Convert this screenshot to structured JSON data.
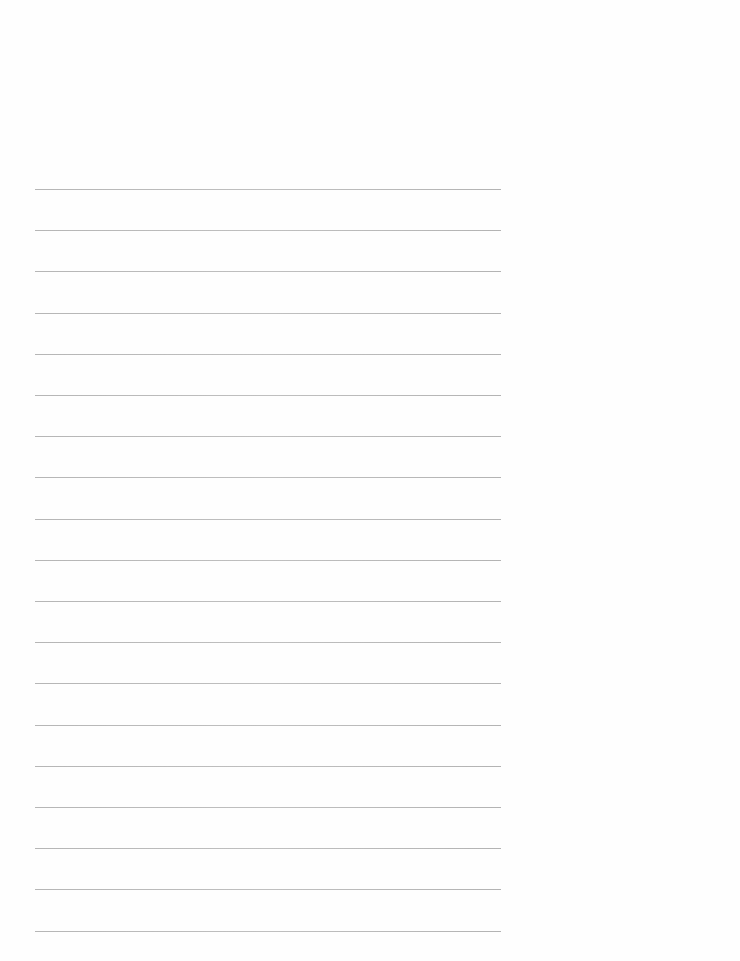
{
  "document": {
    "type": "lined-paper",
    "title": "",
    "ruled_lines": {
      "count": 19,
      "first_line_y": 189,
      "spacing_px": 41.2,
      "left_x": 35,
      "right_x": 501,
      "color": "#b0b0b0"
    },
    "lines": [
      "",
      "",
      "",
      "",
      "",
      "",
      "",
      "",
      "",
      "",
      "",
      "",
      "",
      "",
      "",
      "",
      "",
      "",
      ""
    ]
  }
}
